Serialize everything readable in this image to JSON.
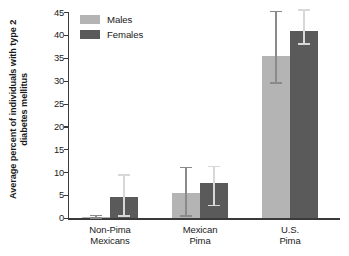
{
  "chart_data": {
    "type": "bar",
    "title": "",
    "subtitle": "",
    "xlabel": "",
    "ylabel": "Average percent of individuals with type 2 diabetes mellitus",
    "ylabel_lines": [
      "Average percent of individuals with",
      "type 2 diabetes mellitus"
    ],
    "categories": [
      "Non-Pima Mexicans",
      "Mexican Pima",
      "U.S. Pima"
    ],
    "category_lines": [
      [
        "Non-Pima",
        "Mexicans"
      ],
      [
        "Mexican",
        "Pima"
      ],
      [
        "U.S.",
        "Pima"
      ]
    ],
    "ylim": [
      0,
      45
    ],
    "yticks": [
      0,
      5,
      10,
      15,
      20,
      25,
      30,
      35,
      40,
      45
    ],
    "ytick_labels": [
      "0",
      "5",
      "10",
      "15",
      "20",
      "25",
      "30",
      "35",
      "40",
      "45"
    ],
    "grid": false,
    "legend_position": "top-left-inside",
    "series": [
      {
        "name": "Males",
        "color": "#b4b4b4",
        "values": [
          0.3,
          5.4,
          35.4
        ],
        "error_low": [
          0.0,
          0.4,
          29.5
        ],
        "error_high": [
          0.6,
          11.0,
          45.1
        ]
      },
      {
        "name": "Females",
        "color": "#5a5a5a",
        "values": [
          4.7,
          7.7,
          40.9
        ],
        "error_low": [
          0.4,
          2.7,
          38.0
        ],
        "error_high": [
          9.4,
          11.2,
          45.4
        ]
      }
    ]
  },
  "legend": {
    "items": [
      {
        "label": "Males",
        "color": "#b4b4b4"
      },
      {
        "label": "Females",
        "color": "#5a5a5a"
      }
    ]
  },
  "axis": {
    "y_title_line1": "Average percent of individuals with",
    "y_title_line2": "type 2 diabetes mellitus",
    "tick_0": "0",
    "tick_5": "5",
    "tick_10": "10",
    "tick_15": "15",
    "tick_20": "20",
    "tick_25": "25",
    "tick_30": "30",
    "tick_35": "35",
    "tick_40": "40",
    "tick_45": "45"
  },
  "xcategories": {
    "cat0_line1": "Non-Pima",
    "cat0_line2": "Mexicans",
    "cat1_line1": "Mexican",
    "cat1_line2": "Pima",
    "cat2_line1": "U.S.",
    "cat2_line2": "Pima"
  }
}
